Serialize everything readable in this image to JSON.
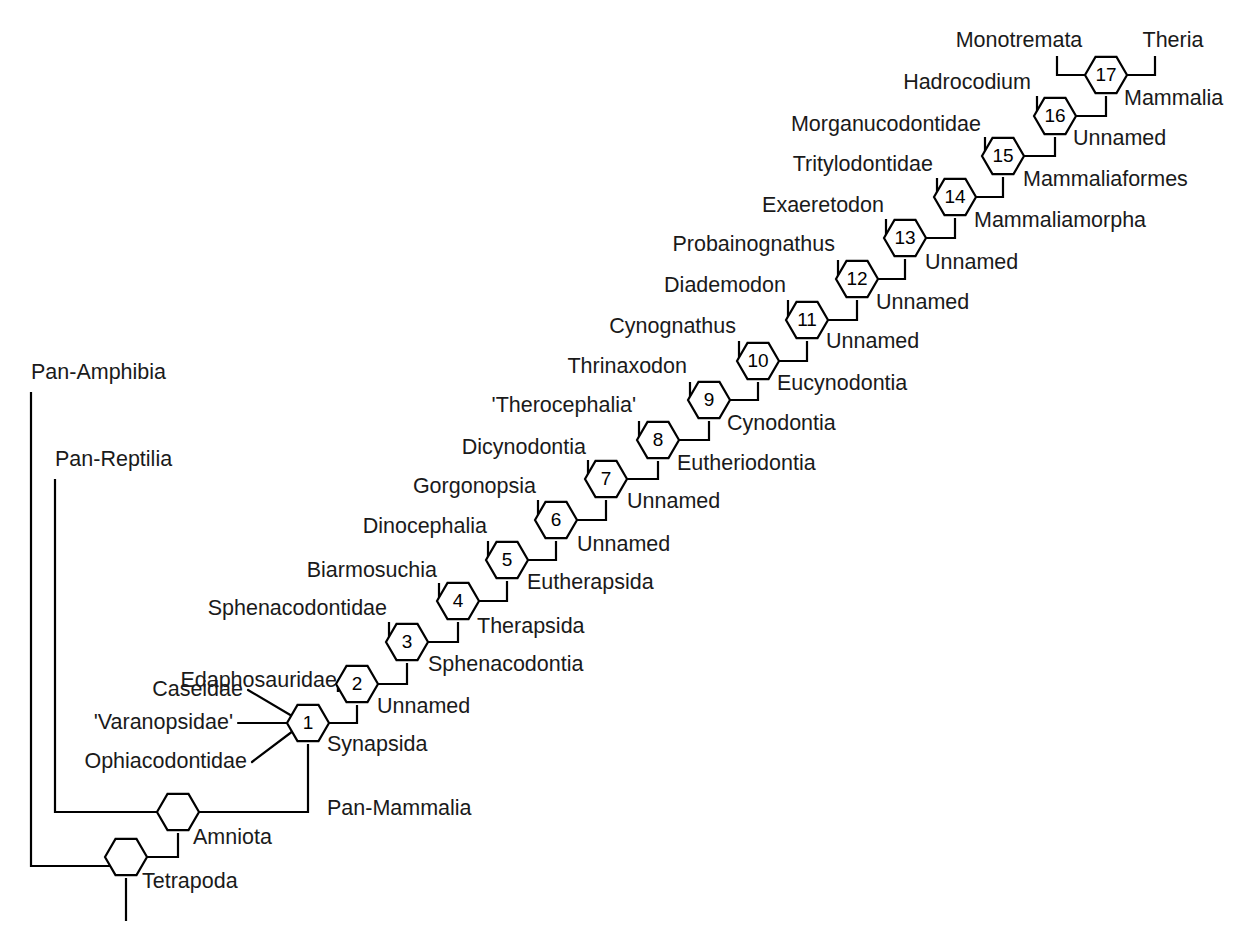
{
  "figure": {
    "type": "cladogram",
    "title": "",
    "background_color": "#ffffff",
    "line_color": "#000000",
    "text_color": "#1a1a1a",
    "width": 1245,
    "height": 934
  },
  "chart_data": {
    "type": "diagram",
    "subtype": "phylogenetic-cladogram",
    "title": "",
    "node_count": 17,
    "numbered_nodes": [
      {
        "number": "1",
        "clade": "Synapsida",
        "x": 308,
        "y": 723
      },
      {
        "number": "2",
        "clade": "Unnamed",
        "x": 357,
        "y": 684
      },
      {
        "number": "3",
        "clade": "Sphenacodontia",
        "x": 407,
        "y": 642
      },
      {
        "number": "4",
        "clade": "Therapsida",
        "x": 458,
        "y": 601
      },
      {
        "number": "5",
        "clade": "Eutherapsida",
        "x": 507,
        "y": 560
      },
      {
        "number": "6",
        "clade": "Unnamed",
        "x": 556,
        "y": 520
      },
      {
        "number": "7",
        "clade": "Unnamed",
        "x": 606,
        "y": 479
      },
      {
        "number": "8",
        "clade": "Eutheriodontia",
        "x": 658,
        "y": 440
      },
      {
        "number": "9",
        "clade": "Cynodontia",
        "x": 709,
        "y": 400
      },
      {
        "number": "10",
        "clade": "Eucynodontia",
        "x": 758,
        "y": 361
      },
      {
        "number": "11",
        "clade": "Unnamed",
        "x": 807,
        "y": 320
      },
      {
        "number": "12",
        "clade": "Unnamed",
        "x": 857,
        "y": 279
      },
      {
        "number": "13",
        "clade": "Unnamed",
        "x": 905,
        "y": 238
      },
      {
        "number": "14",
        "clade": "Mammaliamorpha",
        "x": 955,
        "y": 197
      },
      {
        "number": "15",
        "clade": "Mammaliaformes",
        "x": 1003,
        "y": 156
      },
      {
        "number": "16",
        "clade": "Unnamed",
        "x": 1055,
        "y": 116
      },
      {
        "number": "17",
        "clade": "Mammalia",
        "x": 1106,
        "y": 75
      }
    ],
    "unnumbered_nodes": [
      {
        "clade": "Amniota",
        "x": 178,
        "y": 812
      },
      {
        "clade": "Tetrapoda",
        "x": 126,
        "y": 857
      }
    ],
    "terminal_taxa": [
      "Pan-Amphibia",
      "Pan-Reptilia",
      "Caseidae",
      "'Varanopsidae'",
      "Ophiacodontidae",
      "Edaphosauridae",
      "Sphenacodontidae",
      "Biarmosuchia",
      "Dinocephalia",
      "Gorgonopsia",
      "Dicynodontia",
      "'Therocephalia'",
      "Thrinaxodon",
      "Cynognathus",
      "Diademodon",
      "Probainognathus",
      "Exaeretodon",
      "Tritylodontidae",
      "Morganucodontidae",
      "Hadrocodium",
      "Monotremata",
      "Theria"
    ],
    "clade_names_in_order": [
      "Tetrapoda",
      "Amniota",
      "Pan-Mammalia",
      "Synapsida",
      "Unnamed",
      "Sphenacodontia",
      "Therapsida",
      "Eutherapsida",
      "Unnamed",
      "Unnamed",
      "Eutheriodontia",
      "Cynodontia",
      "Eucynodontia",
      "Unnamed",
      "Unnamed",
      "Unnamed",
      "Mammaliamorpha",
      "Mammaliaformes",
      "Unnamed",
      "Mammalia"
    ]
  },
  "labels": {
    "pan_amphibia": {
      "text": "Pan-Amphibia",
      "x": 31,
      "y": 379,
      "anchor": "start"
    },
    "pan_reptilia": {
      "text": "Pan-Reptilia",
      "x": 55,
      "y": 466,
      "anchor": "start"
    },
    "tetrapoda": {
      "text": "Tetrapoda",
      "x": 142,
      "y": 888,
      "anchor": "start"
    },
    "amniota": {
      "text": "Amniota",
      "x": 193,
      "y": 844,
      "anchor": "start"
    },
    "pan_mammalia": {
      "text": "Pan-Mammalia",
      "x": 327,
      "y": 815,
      "anchor": "start"
    },
    "caseidae": {
      "text": "Caseidae",
      "x": 243,
      "y": 696,
      "anchor": "end"
    },
    "varanopsidae": {
      "text": "'Varanopsidae'",
      "x": 233,
      "y": 729,
      "anchor": "end"
    },
    "ophiacodontidae": {
      "text": "Ophiacodontidae",
      "x": 247,
      "y": 768,
      "anchor": "end"
    },
    "synapsida": {
      "text": "Synapsida",
      "x": 327,
      "y": 751,
      "anchor": "start"
    },
    "edaphosauridae": {
      "text": "Edaphosauridae",
      "x": 337,
      "y": 687,
      "anchor": "end"
    },
    "unnamed_2": {
      "text": "Unnamed",
      "x": 377,
      "y": 713,
      "anchor": "start"
    },
    "sphenacodontidae": {
      "text": "Sphenacodontidae",
      "x": 387,
      "y": 615,
      "anchor": "end"
    },
    "sphenacodontia": {
      "text": "Sphenacodontia",
      "x": 428,
      "y": 671,
      "anchor": "start"
    },
    "biarmosuchia": {
      "text": "Biarmosuchia",
      "x": 437,
      "y": 577,
      "anchor": "end"
    },
    "therapsida": {
      "text": "Therapsida",
      "x": 477,
      "y": 633,
      "anchor": "start"
    },
    "dinocephalia": {
      "text": "Dinocephalia",
      "x": 487,
      "y": 533,
      "anchor": "end"
    },
    "eutherapsida": {
      "text": "Eutherapsida",
      "x": 527,
      "y": 589,
      "anchor": "start"
    },
    "gorgonopsia": {
      "text": "Gorgonopsia",
      "x": 536,
      "y": 493,
      "anchor": "end"
    },
    "unnamed_6": {
      "text": "Unnamed",
      "x": 577,
      "y": 551,
      "anchor": "start"
    },
    "dicynodontia": {
      "text": "Dicynodontia",
      "x": 586,
      "y": 454,
      "anchor": "end"
    },
    "unnamed_7": {
      "text": "Unnamed",
      "x": 627,
      "y": 508,
      "anchor": "start"
    },
    "therocephalia": {
      "text": "'Therocephalia'",
      "x": 636,
      "y": 412,
      "anchor": "end"
    },
    "eutheriodontia": {
      "text": "Eutheriodontia",
      "x": 677,
      "y": 470,
      "anchor": "start"
    },
    "thrinaxodon": {
      "text": "Thrinaxodon",
      "x": 687,
      "y": 373,
      "anchor": "end"
    },
    "cynodontia": {
      "text": "Cynodontia",
      "x": 727,
      "y": 430,
      "anchor": "start"
    },
    "cynognathus": {
      "text": "Cynognathus",
      "x": 736,
      "y": 333,
      "anchor": "end"
    },
    "eucynodontia": {
      "text": "Eucynodontia",
      "x": 777,
      "y": 390,
      "anchor": "start"
    },
    "diademodon": {
      "text": "Diademodon",
      "x": 786,
      "y": 292,
      "anchor": "end"
    },
    "unnamed_11": {
      "text": "Unnamed",
      "x": 826,
      "y": 348,
      "anchor": "start"
    },
    "probainognathus": {
      "text": "Probainognathus",
      "x": 835,
      "y": 251,
      "anchor": "end"
    },
    "unnamed_12": {
      "text": "Unnamed",
      "x": 876,
      "y": 309,
      "anchor": "start"
    },
    "exaeretodon": {
      "text": "Exaeretodon",
      "x": 884,
      "y": 212,
      "anchor": "end"
    },
    "unnamed_13": {
      "text": "Unnamed",
      "x": 925,
      "y": 269,
      "anchor": "start"
    },
    "tritylodontidae": {
      "text": "Tritylodontidae",
      "x": 933,
      "y": 171,
      "anchor": "end"
    },
    "mammaliamorpha": {
      "text": "Mammaliamorpha",
      "x": 974,
      "y": 227,
      "anchor": "start"
    },
    "morganucodontidae": {
      "text": "Morganucodontidae",
      "x": 981,
      "y": 131,
      "anchor": "end"
    },
    "mammaliaformes": {
      "text": "Mammaliaformes",
      "x": 1023,
      "y": 186,
      "anchor": "start"
    },
    "hadrocodium": {
      "text": "Hadrocodium",
      "x": 1031,
      "y": 89,
      "anchor": "end"
    },
    "unnamed_16": {
      "text": "Unnamed",
      "x": 1073,
      "y": 145,
      "anchor": "start"
    },
    "monotremata": {
      "text": "Monotremata",
      "x": 1019,
      "y": 47,
      "anchor": "middle"
    },
    "theria": {
      "text": "Theria",
      "x": 1173,
      "y": 47,
      "anchor": "middle"
    },
    "mammalia": {
      "text": "Mammalia",
      "x": 1124,
      "y": 105,
      "anchor": "start"
    }
  },
  "geometry": {
    "hex_rx": 21,
    "hex_ry": 21,
    "stroke_width": 2.2,
    "branches": [
      {
        "name": "pan-amphibia-stem",
        "d": "M 31 392 L 31 866 L 126 866"
      },
      {
        "name": "pan-reptilia-stem",
        "d": "M 55 479 L 55 812 L 159 812"
      },
      {
        "name": "tetrapoda-root",
        "d": "M 126 878 L 126 921"
      },
      {
        "name": "tetrapoda-to-amniota",
        "d": "M 145 857 L 178 857 L 178 833"
      },
      {
        "name": "amniota-to-synapsida",
        "d": "M 197 812 L 308 812 L 308 744"
      },
      {
        "name": "node1-to-node2",
        "d": "M 327 723 L 357 723 L 357 705"
      },
      {
        "name": "node2-to-node3",
        "d": "M 376 684 L 407 684 L 407 663"
      },
      {
        "name": "node3-to-node4",
        "d": "M 426 642 L 458 642 L 458 622"
      },
      {
        "name": "node4-to-node5",
        "d": "M 477 601 L 507 601 L 507 581"
      },
      {
        "name": "node5-to-node6",
        "d": "M 526 560 L 556 560 L 556 541"
      },
      {
        "name": "node6-to-node7",
        "d": "M 575 520 L 606 520 L 606 500"
      },
      {
        "name": "node7-to-node8",
        "d": "M 625 479 L 658 479 L 658 461"
      },
      {
        "name": "node8-to-node9",
        "d": "M 677 440 L 709 440 L 709 421"
      },
      {
        "name": "node9-to-node10",
        "d": "M 728 400 L 758 400 L 758 382"
      },
      {
        "name": "node10-to-node11",
        "d": "M 777 361 L 807 361 L 807 341"
      },
      {
        "name": "node11-to-node12",
        "d": "M 826 320 L 857 320 L 857 300"
      },
      {
        "name": "node12-to-node13",
        "d": "M 876 279 L 905 279 L 905 259"
      },
      {
        "name": "node13-to-node14",
        "d": "M 924 238 L 955 238 L 955 218"
      },
      {
        "name": "node14-to-node15",
        "d": "M 974 197 L 1003 197 L 1003 177"
      },
      {
        "name": "node15-to-node16",
        "d": "M 1022 156 L 1055 156 L 1055 137"
      },
      {
        "name": "node16-to-node17",
        "d": "M 1074 116 L 1106 116 L 1106 96"
      },
      {
        "name": "edaphosauridae-branch",
        "d": "M 338 692 L 338 684 L 338 684 L 338 684 L 338 684 L 338 684 L 338 684 L 338 684 L 338 684 L 338 684 L 338 684 L 338 684 M 338 692 L 338 684 L 338 684"
      },
      {
        "name": "node2-left",
        "d": "M 338 692 L 338 684 L 337 684"
      },
      {
        "name": "node3-left",
        "d": "M 389 622 L 389 642 L 388 642"
      },
      {
        "name": "node4-left",
        "d": "M 439 583 L 439 601 L 438 601"
      },
      {
        "name": "node5-left",
        "d": "M 488 541 L 488 560 L 487 560"
      },
      {
        "name": "node6-left",
        "d": "M 538 500 L 538 520 L 537 520"
      },
      {
        "name": "node7-left",
        "d": "M 588 460 L 588 479 L 587 479"
      },
      {
        "name": "node8-left",
        "d": "M 639 421 L 639 440 L 638 440"
      },
      {
        "name": "node9-left",
        "d": "M 690 382 L 690 400 L 689 400"
      },
      {
        "name": "node10-left",
        "d": "M 739 341 L 739 361 L 738 361"
      },
      {
        "name": "node11-left",
        "d": "M 788 300 L 788 320 L 787 320"
      },
      {
        "name": "node12-left",
        "d": "M 838 260 L 838 279 L 837 279"
      },
      {
        "name": "node13-left",
        "d": "M 886 219 L 886 238 L 885 238"
      },
      {
        "name": "node14-left",
        "d": "M 937 178 L 937 197 L 936 197"
      },
      {
        "name": "node15-left",
        "d": "M 985 137 L 985 156 L 984 156"
      },
      {
        "name": "node16-left",
        "d": "M 1037 96 L 1037 116 L 1036 116"
      },
      {
        "name": "node17-left",
        "d": "M 1057 56 L 1057 75 L 1085 75"
      },
      {
        "name": "node17-right",
        "d": "M 1155 56 L 1155 75 L 1127 75"
      }
    ],
    "leaders": [
      {
        "name": "caseidae-leader",
        "d": "M 248 690 L 292 716"
      },
      {
        "name": "varanopsidae-leader",
        "d": "M 238 723 L 287 723"
      },
      {
        "name": "ophiacodontidae-leader",
        "d": "M 252 762 L 293 731"
      }
    ],
    "vertical_stubs": [
      {
        "name": "node3-left-stub",
        "x": 389,
        "y1": 622,
        "y2": 642
      },
      {
        "name": "node4-left-stub",
        "x": 439,
        "y1": 583,
        "y2": 601
      }
    ]
  }
}
